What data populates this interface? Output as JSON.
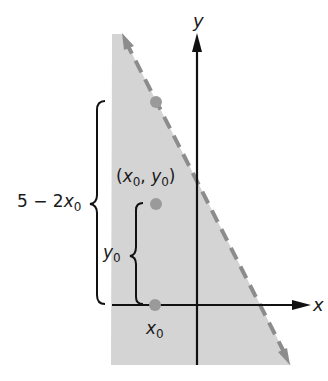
{
  "diagram": {
    "axes": {
      "x_label": "x",
      "y_label": "y"
    },
    "region": {
      "description": "half-plane y < 5 - 2x (shaded, boundary dashed)",
      "fill": "#d4d4d4",
      "boundary_color": "#8c8c8c"
    },
    "labels": {
      "point": {
        "open": "(",
        "x": "x",
        "x_sub": "0",
        "comma": ", ",
        "y": "y",
        "y_sub": "0",
        "close": ")"
      },
      "big_brace": {
        "prefix": "5 − 2",
        "var": "x",
        "sub": "0"
      },
      "small_brace": {
        "var": "y",
        "sub": "0"
      },
      "x0": {
        "var": "x",
        "sub": "0"
      }
    },
    "points": [
      {
        "name": "boundary-point",
        "cx": 156,
        "cy": 102
      },
      {
        "name": "point-x0-y0",
        "cx": 156,
        "cy": 204
      },
      {
        "name": "point-x0-axis",
        "cx": 155,
        "cy": 305
      }
    ],
    "colors": {
      "axis": "#111111",
      "point": "#9a9a9a",
      "fill": "#d4d4d4",
      "dash": "#8c8c8c"
    }
  }
}
